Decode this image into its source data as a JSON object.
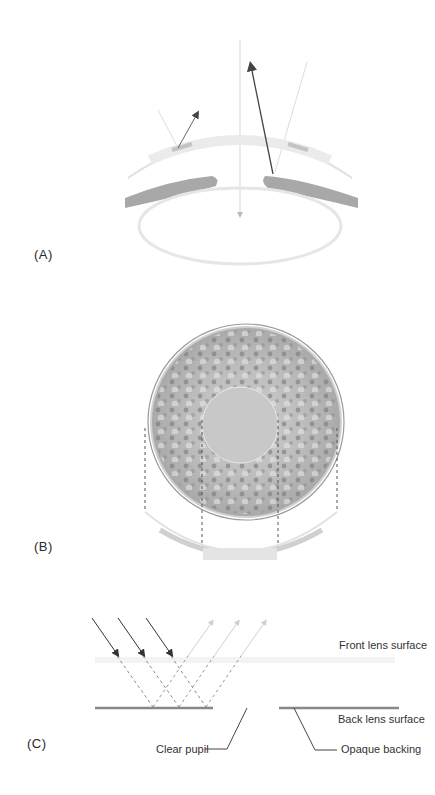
{
  "panels": {
    "a": {
      "label": "(A)"
    },
    "b": {
      "label": "(B)"
    },
    "c": {
      "label": "(C)",
      "annotations": {
        "front_surface": "Front lens surface",
        "back_surface": "Back lens surface",
        "clear_pupil": "Clear pupil",
        "opaque_backing": "Opaque backing"
      }
    }
  },
  "colors": {
    "iris_fill": "#a8a8a8",
    "cornea_stroke": "#d8d8d8",
    "arrow_dark": "#444444",
    "arrow_light": "#cccccc",
    "lens_surface": "#888888",
    "pattern_base": "#b5b5b5",
    "pupil_fill": "#c8c8c8"
  }
}
